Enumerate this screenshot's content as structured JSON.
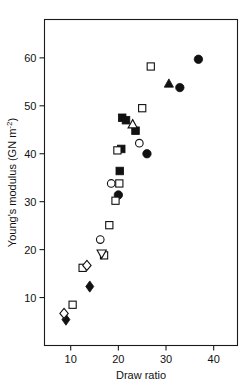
{
  "chart_data": {
    "type": "scatter",
    "title": "",
    "xlabel": "Draw ratio",
    "ylabel": "Young's modulus (GN m",
    "ylabel_sup": "-2",
    "ylabel_tail": ")",
    "xlim": [
      4.5,
      45
    ],
    "ylim": [
      0,
      68
    ],
    "xticks": [
      10,
      20,
      30,
      40
    ],
    "yticks": [
      10,
      20,
      30,
      40,
      50,
      60
    ],
    "xtick_labels": [
      "10",
      "20",
      "30",
      "40"
    ],
    "ytick_labels": [
      "10",
      "20",
      "30",
      "40",
      "50",
      "60"
    ],
    "grid": false,
    "legend": "none",
    "marker_color": "#111111",
    "axis_color": "#1a1a1a",
    "series": [
      {
        "name": "filled-circle",
        "marker": "filled-circle",
        "points": [
          [
            20.0,
            31.4
          ],
          [
            26.0,
            40.0
          ],
          [
            32.9,
            53.8
          ],
          [
            36.8,
            59.7
          ]
        ]
      },
      {
        "name": "open-circle",
        "marker": "open-circle",
        "points": [
          [
            16.2,
            22.1
          ],
          [
            18.5,
            33.8
          ],
          [
            24.4,
            42.2
          ]
        ]
      },
      {
        "name": "filled-square",
        "marker": "filled-square",
        "points": [
          [
            20.3,
            36.4
          ],
          [
            20.6,
            41.0
          ],
          [
            20.8,
            47.5
          ],
          [
            21.6,
            47.0
          ],
          [
            23.6,
            44.8
          ]
        ]
      },
      {
        "name": "open-square",
        "marker": "open-square",
        "points": [
          [
            10.4,
            8.5
          ],
          [
            12.5,
            16.2
          ],
          [
            17.0,
            18.8
          ],
          [
            18.1,
            25.1
          ],
          [
            19.4,
            30.2
          ],
          [
            20.2,
            33.8
          ],
          [
            19.8,
            40.7
          ],
          [
            25.0,
            49.5
          ],
          [
            26.8,
            58.2
          ]
        ]
      },
      {
        "name": "filled-diamond",
        "marker": "filled-diamond",
        "points": [
          [
            9.0,
            5.4
          ],
          [
            14.0,
            12.3
          ]
        ]
      },
      {
        "name": "open-diamond",
        "marker": "open-diamond",
        "points": [
          [
            8.6,
            6.7
          ],
          [
            13.4,
            16.7
          ]
        ]
      },
      {
        "name": "open-triangle-up",
        "marker": "open-triangle-up",
        "points": [
          [
            23.0,
            46.2
          ]
        ]
      },
      {
        "name": "filled-triangle-up",
        "marker": "filled-triangle-up",
        "points": [
          [
            30.6,
            54.7
          ]
        ]
      },
      {
        "name": "open-triangle-down",
        "marker": "open-triangle-down",
        "points": [
          [
            16.5,
            19.1
          ]
        ]
      }
    ]
  }
}
